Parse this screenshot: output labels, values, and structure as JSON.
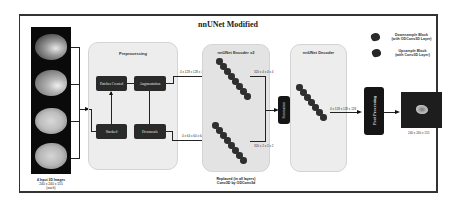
{
  "diagram": {
    "title": "nnUNet Modified",
    "input": {
      "caption_line1": "4 Input 3D Images",
      "caption_line2": "240 x 240 x 155",
      "caption_line3": "(each)"
    },
    "preprocessing": {
      "title": "Preprocessing",
      "boxes": {
        "patches": "Patches Created",
        "augmentation": "Augmentation",
        "stacked": "Stacked",
        "downscale": "Downscale"
      }
    },
    "edges": {
      "aug_to_encoder": "4 x 128 x 128 x 128",
      "down_to_encoder": "4 x 64 x 64 x 64",
      "encoder_top_out": "320 x 4 x 4 x 4",
      "encoder_bottom_out": "320 x 2 x 2 x 2",
      "decoder_out": "4 x 128 x 128 x 128"
    },
    "encoder": {
      "title": "nnUNet Encoder x2",
      "caption_line1": "Replaced (in all layers)",
      "caption_line2": "Conv3D by ODConv3d"
    },
    "combine": {
      "label": "Summation"
    },
    "decoder": {
      "title": "nnUNet Decoder"
    },
    "postprocessing": {
      "label": "Post Processing"
    },
    "output": {
      "caption": "240 x 240 x 155"
    },
    "legend": {
      "items": [
        {
          "line1": "Downsample Block",
          "line2": "(with ODConv3D Layer)",
          "icon": "dark-blob-icon"
        },
        {
          "line1": "Upsample Block",
          "line2": "(with Conv3D Layer)",
          "icon": "dark-blob-icon"
        }
      ]
    }
  }
}
